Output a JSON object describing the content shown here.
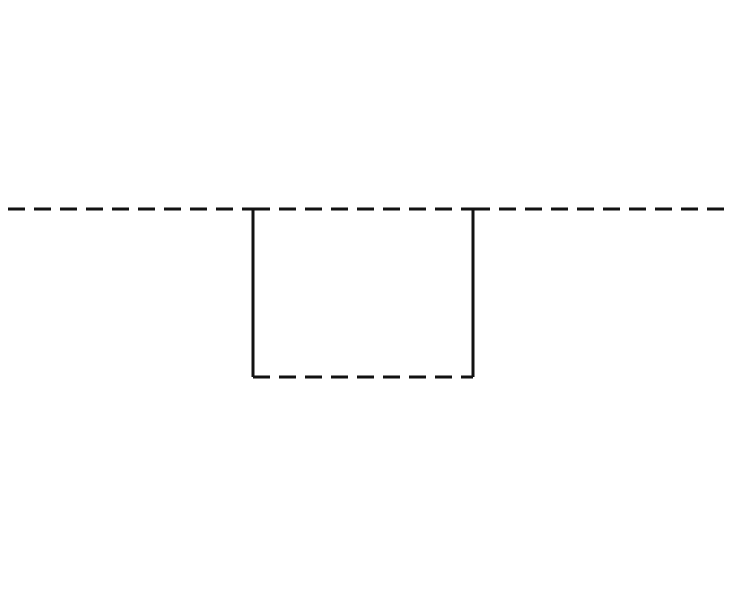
{
  "diagram": {
    "canvas": {
      "width": 737,
      "height": 597,
      "background": "#ffffff"
    },
    "stroke_color": "#111111",
    "stroke_width": 3,
    "dash_pattern": "17,9",
    "segments": [
      {
        "name": "top-dashed-line-left",
        "x1": 8,
        "y1": 209,
        "x2": 253,
        "y2": 209,
        "style": "dashed"
      },
      {
        "name": "top-dashed-line-middle",
        "x1": 253,
        "y1": 209,
        "x2": 473,
        "y2": 209,
        "style": "dashed"
      },
      {
        "name": "top-dashed-line-right",
        "x1": 473,
        "y1": 209,
        "x2": 728,
        "y2": 209,
        "style": "dashed"
      },
      {
        "name": "notch-left-side",
        "x1": 253,
        "y1": 209,
        "x2": 253,
        "y2": 377,
        "style": "solid"
      },
      {
        "name": "notch-right-side",
        "x1": 473,
        "y1": 209,
        "x2": 473,
        "y2": 377,
        "style": "solid"
      },
      {
        "name": "notch-bottom",
        "x1": 253,
        "y1": 377,
        "x2": 473,
        "y2": 377,
        "style": "dashed"
      }
    ]
  }
}
